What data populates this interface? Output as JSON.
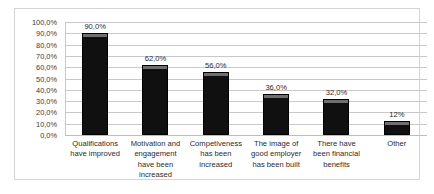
{
  "chart_data": {
    "type": "bar",
    "title": "",
    "subtitle": "",
    "xlabel": "",
    "ylabel": "",
    "ylim": [
      0,
      100
    ],
    "grid": true,
    "legend": false,
    "legend_position": "none",
    "orientation": "vertical",
    "bar_color": "#101010",
    "bar_cap_color": "#6f6f6f",
    "gridline_color": "#c9c9c9",
    "border_color": "#d4d4d4",
    "categories": [
      "Qualifications have improved",
      "Motivation and engagement have been increased",
      "Competiveness has been increased",
      "The image of good employer has been built",
      "There have been financial benefits",
      "Other"
    ],
    "category_lines": [
      [
        "Qualifications",
        "have improved"
      ],
      [
        "Motivation and",
        "engagement",
        "have been",
        "increased"
      ],
      [
        "Competiveness",
        "has been",
        "increased"
      ],
      [
        "The image of",
        "good employer",
        "has been built"
      ],
      [
        "There have",
        "been financial",
        "benefits"
      ],
      [
        "Other"
      ]
    ],
    "values": [
      90.0,
      62.0,
      56.0,
      36.0,
      32.0,
      12.0
    ],
    "data_labels": [
      "90,0%",
      "62,0%",
      "56,0%",
      "36,0%",
      "32,0%",
      "12%"
    ],
    "ytick_values": [
      0,
      10,
      20,
      30,
      40,
      50,
      60,
      70,
      80,
      90,
      100
    ],
    "ytick_labels": [
      "0,0%",
      "10,0%",
      "20,0%",
      "30,0%",
      "40,0%",
      "50,0%",
      "60,0%",
      "70,0%",
      "80,0%",
      "90,0%",
      "100,0%"
    ]
  }
}
